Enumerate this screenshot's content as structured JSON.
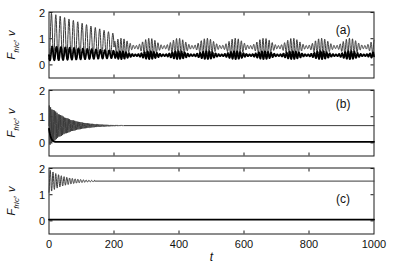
{
  "figure": {
    "background": "#ffffff",
    "frame_color": "#1a1a1a",
    "text_color": "#111111",
    "x_axis": {
      "label": "t",
      "min": 0,
      "max": 1000,
      "tick_values": [
        0,
        200,
        400,
        600,
        800,
        1000
      ],
      "tick_labels": [
        "0",
        "200",
        "400",
        "600",
        "800",
        "1000"
      ]
    },
    "y_axis": {
      "label_f": "F",
      "label_sub": "fric",
      "label_comma": ", ",
      "label_v": "v",
      "min": -0.5,
      "max": 2.02,
      "tick_values": [
        0,
        1,
        2
      ],
      "tick_labels": [
        "0",
        "1",
        "2"
      ]
    }
  },
  "styles": {
    "thin": {
      "color": "#3a3a3a",
      "width": 1.0
    },
    "thick": {
      "color": "#000000",
      "width": 1.8
    }
  },
  "chart_data": [
    {
      "type": "line",
      "panel_label": "(a)",
      "xlabel": "t",
      "ylabel": "F_fric, v",
      "xlim": [
        0,
        1000
      ],
      "ylim": [
        -0.5,
        2.02
      ],
      "x_ticks": [
        0,
        200,
        400,
        600,
        800,
        1000
      ],
      "y_ticks": [
        0,
        1,
        2
      ],
      "grid": false,
      "label_pos": {
        "t": 905,
        "v": 1.33
      },
      "description": "Thin F_fric curve: periodic stick-slip oscillation, peaks decaying from 2.0 to ~1.2 over t=0-200 (period ~13.5), troughs ~0.3; after t~200 irregular modulated oscillation about 0.68 with bursts every ~88 t. Thick v curve: oscillates 0.15-0.7 in phase opposition, then about 0.37 with matching bursts.",
      "series": [
        {
          "name": "F_fric",
          "style": "thin",
          "segments": [
            {
              "t0": 0,
              "t1": 200,
              "b0": 1.1,
              "b1": 0.78,
              "a0": 0.9,
              "a1": 0.42,
              "p": 13.5,
              "ph": -1.9
            },
            {
              "t0": 200,
              "t1": 1000,
              "b0": 0.68,
              "a0": 0.2,
              "m": 0.7,
              "pm": 88,
              "p": 9.5,
              "ph": 0
            }
          ]
        },
        {
          "name": "v",
          "style": "thick",
          "segments": [
            {
              "t0": 0,
              "t1": 200,
              "b0": 0.44,
              "b1": 0.4,
              "a0": 0.27,
              "a1": 0.14,
              "p": 13.5,
              "ph": -2.9
            },
            {
              "t0": 200,
              "t1": 1000,
              "b0": 0.37,
              "a0": 0.09,
              "m": 0.65,
              "pm": 88,
              "p": 9.5,
              "ph": 2.2
            }
          ]
        }
      ]
    },
    {
      "type": "line",
      "panel_label": "(b)",
      "xlabel": "t",
      "ylabel": "F_fric, v",
      "xlim": [
        0,
        1000
      ],
      "ylim": [
        -0.5,
        2.02
      ],
      "x_ticks": [
        0,
        200,
        400,
        600,
        800,
        1000
      ],
      "y_ticks": [
        0,
        1,
        2
      ],
      "grid": false,
      "label_pos": {
        "t": 905,
        "v": 1.5
      },
      "description": "Thin F_fric curve: fast oscillation (period ~3.9) about 0.66 with envelope ~0.78 decaying exponentially (tau~55), converged to flat 0.66 by t~230. Thick v curve: starts ~0.55, decays within t<20 to flat ~0.04.",
      "series": [
        {
          "name": "F_fric",
          "style": "thin",
          "segments": [
            {
              "t0": 0,
              "t1": 230,
              "b0": 0.66,
              "a0": 0.78,
              "tau": 55,
              "p": 3.9,
              "ph": 0
            },
            {
              "t0": 230,
              "t1": 1000,
              "b0": 0.66
            }
          ]
        },
        {
          "name": "v",
          "style": "thick",
          "segments": [
            {
              "t0": 0,
              "t1": 20,
              "b0": 0.04,
              "a0": 0.5,
              "tau": 6,
              "p": 80,
              "ph": 1.57
            },
            {
              "t0": 20,
              "t1": 1000,
              "b0": 0.04
            }
          ]
        }
      ]
    },
    {
      "type": "line",
      "panel_label": "(c)",
      "xlabel": "t",
      "ylabel": "F_fric, v",
      "xlim": [
        0,
        1000
      ],
      "ylim": [
        -0.5,
        2.02
      ],
      "x_ticks": [
        0,
        200,
        400,
        600,
        800,
        1000
      ],
      "y_ticks": [
        0,
        1,
        2
      ],
      "grid": false,
      "label_pos": {
        "t": 905,
        "v": 0.85
      },
      "description": "Thin F_fric curve: starts ~1.1, ringing oscillation about 1.52 (period ~8.5, envelope decaying tau~48), flat at ~1.52 after t~140 to t=1000. Thick v curve: flat at ~0.05 for entire range.",
      "series": [
        {
          "name": "F_fric",
          "style": "thin",
          "segments": [
            {
              "t0": 0,
              "t1": 140,
              "b0": 1.52,
              "a0": 0.45,
              "tau": 48,
              "p": 8.5,
              "ph": -1.25
            },
            {
              "t0": 140,
              "t1": 1000,
              "b0": 1.52
            }
          ]
        },
        {
          "name": "v",
          "style": "thick",
          "segments": [
            {
              "t0": 0,
              "t1": 1000,
              "b0": 0.05
            }
          ]
        }
      ]
    }
  ]
}
